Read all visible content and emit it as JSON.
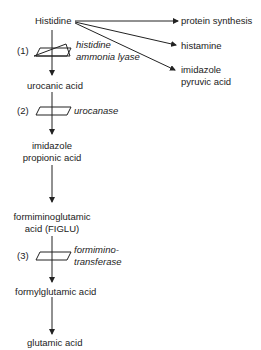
{
  "diagram": {
    "type": "metabolic-pathway",
    "start": "Histidine",
    "side_products": [
      "protein synthesis",
      "histamine",
      "imidazole pyruvic acid"
    ],
    "side_product_lines": {
      "protein_synthesis": "protein synthesis",
      "histamine": "histamine",
      "imidazole_pyruvic_1": "imidazole",
      "imidazole_pyruvic_2": "pyruvic acid"
    },
    "steps": [
      {
        "number": "(1)",
        "enzyme_line1": "histidine",
        "enzyme_line2": "ammonia lyase"
      },
      {
        "number": "(2)",
        "enzyme_line1": "urocanase"
      },
      {
        "number": "(3)",
        "enzyme_line1": "formimino-",
        "enzyme_line2": "transferase"
      }
    ],
    "intermediates": {
      "urocanic": "urocanic acid",
      "imidazole_propionic_1": "imidazole",
      "imidazole_propionic_2": "propionic acid",
      "figlu_1": "formiminoglutamic",
      "figlu_2": "acid (FIGLU)",
      "formylglutamic": "formylglutamic acid",
      "glutamic": "glutamic acid"
    }
  }
}
